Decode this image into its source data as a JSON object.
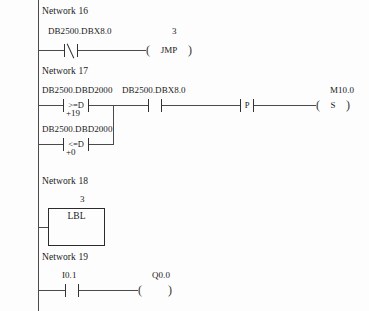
{
  "document": {
    "kind": "ladder-logic-diagram",
    "language": "LAD",
    "rail_color": "#4a4a4a",
    "line_color": "#333333",
    "background_color": "#fdfdfd"
  },
  "networks": [
    {
      "id": "network-16",
      "label": "Network 16",
      "elements": {
        "contact_operand": "DB2500.DBX8.0",
        "contact_type": "normally-closed",
        "contact_symbol": "",
        "coil_label": "3",
        "coil_text": "JMP"
      }
    },
    {
      "id": "network-17",
      "label": "Network 17",
      "elements": {
        "branch_a_operand": "DB2500.DBD2000",
        "branch_a_symbol": ">=D",
        "branch_a_value": "+19",
        "branch_b_operand": "DB2500.DBD2000",
        "branch_b_symbol": "<=D",
        "branch_b_value": "+0",
        "series_contact_operand": "DB2500.DBX8.0",
        "series_contact_type": "normally-open",
        "edge_contact_symbol": "P",
        "coil_label": "M10.0",
        "coil_text": "S"
      }
    },
    {
      "id": "network-18",
      "label": "Network 18",
      "elements": {
        "block_label": "3",
        "block_text": "LBL"
      }
    },
    {
      "id": "network-19",
      "label": "Network 19",
      "elements": {
        "contact_operand": "I0.1",
        "contact_type": "normally-open",
        "coil_label": "Q0.0",
        "coil_text": ""
      }
    }
  ]
}
